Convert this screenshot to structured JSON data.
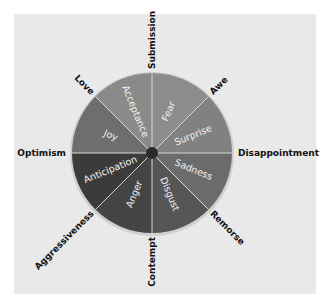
{
  "diagram": {
    "title": "",
    "center": {
      "x": 152,
      "y": 153
    },
    "radius": 80,
    "colors": {
      "panel_bg": "#e9e9e9",
      "divider": "#d8d8d8",
      "rim": "#cfcfcf",
      "hub": "#2a2a2a",
      "segment_text": "#f2f2f2",
      "outer_text": "#111111"
    },
    "primary_emotions": [
      {
        "label": "Fear",
        "start": 270,
        "end": 315,
        "color": "#8c8c8c"
      },
      {
        "label": "Surprise",
        "start": 315,
        "end": 360,
        "color": "#818181"
      },
      {
        "label": "Sadness",
        "start": 0,
        "end": 45,
        "color": "#6b6b6b"
      },
      {
        "label": "Disgust",
        "start": 45,
        "end": 90,
        "color": "#565656"
      },
      {
        "label": "Anger",
        "start": 90,
        "end": 135,
        "color": "#444444"
      },
      {
        "label": "Anticipation",
        "start": 135,
        "end": 180,
        "color": "#3b3b3b"
      },
      {
        "label": "Joy",
        "start": 180,
        "end": 225,
        "color": "#6e6e6e"
      },
      {
        "label": "Acceptance",
        "start": 225,
        "end": 270,
        "color": "#8a8a8a"
      }
    ],
    "combined_emotions": [
      {
        "label": "Submission",
        "angle": 270
      },
      {
        "label": "Awe",
        "angle": 315
      },
      {
        "label": "Disappointment",
        "angle": 0
      },
      {
        "label": "Remorse",
        "angle": 45
      },
      {
        "label": "Contempt",
        "angle": 90
      },
      {
        "label": "Aggressiveness",
        "angle": 135
      },
      {
        "label": "Optimism",
        "angle": 180
      },
      {
        "label": "Love",
        "angle": 225
      }
    ]
  }
}
